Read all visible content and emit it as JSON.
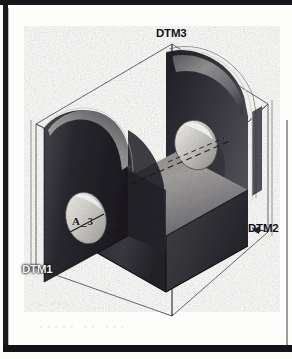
{
  "figure": {
    "kind": "isometric-3d-shaded-cad-model",
    "background_color": "#fdfdfc",
    "border_color": "#17161a",
    "shading": "grayscale gouraud shaded solid with visible raster scan noise"
  },
  "datum_planes": [
    {
      "id": "dtm3",
      "label": "DTM3",
      "orientation": "top horizontal plane",
      "label_position": "top-center",
      "style": "thin wireframe outline",
      "on_dark_background": false
    },
    {
      "id": "dtm2",
      "label": "DTM2",
      "orientation": "right vertical plane",
      "label_position": "right-middle",
      "style": "thin wireframe outline",
      "on_dark_background": false
    },
    {
      "id": "dtm1",
      "label": "DTM1",
      "orientation": "left vertical plane",
      "label_position": "bottom-left",
      "style": "thin wireframe outline",
      "on_dark_background": true
    }
  ],
  "datum_axis": {
    "id": "a-3",
    "label": "A_3",
    "description": "axis of the coaxial through-holes",
    "leader": "short leader line across the near hole",
    "centerline_style": "dashed"
  },
  "geometry": {
    "holes": [
      {
        "id": "near-hole",
        "face": "left arm inner/near face",
        "appearance": "light elliptical bore"
      },
      {
        "id": "far-hole",
        "face": "right arm face",
        "appearance": "light elliptical bore with dashed centerline"
      }
    ],
    "faces": [
      {
        "id": "left-arm-outer",
        "tone": "dark"
      },
      {
        "id": "left-arm-front",
        "tone": "very-dark"
      },
      {
        "id": "right-arm-inner",
        "tone": "dark-gradient"
      },
      {
        "id": "base-top",
        "tone": "mid-light"
      },
      {
        "id": "base-front",
        "tone": "dark"
      }
    ]
  },
  "scan_artifacts": {
    "ghost_text": [
      "·· ····",
      "····· ·· ···",
      "· ···"
    ],
    "note": "faint bleed-through from the reverse side of the scanned page"
  },
  "colors": {
    "ink": "#121116",
    "label_on_dark": "#f2f1ef",
    "paper": "#fdfdfc",
    "wireframe": "#2a2930"
  }
}
